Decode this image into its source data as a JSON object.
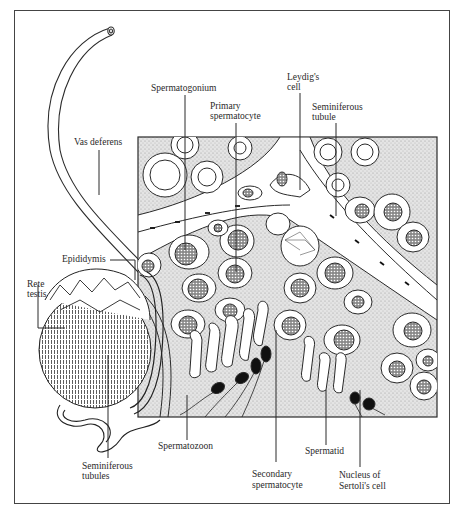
{
  "figure": {
    "labels": {
      "vas_deferens": "Vas deferens",
      "epididymis": "Epididymis",
      "rete_testis_1": "Rete",
      "rete_testis_2": "testis",
      "seminiferous_tubules_1": "Seminiferous",
      "seminiferous_tubules_2": "tubules",
      "spermatogonium": "Spermatogonium",
      "primary_spermatocyte_1": "Primary",
      "primary_spermatocyte_2": "spermatocyte",
      "leydigs_cell_1": "Leydig's",
      "leydigs_cell_2": "cell",
      "seminiferous_tubule_1": "Seminiferous",
      "seminiferous_tubule_2": "tubule",
      "spermatozoon": "Spermatozoon",
      "secondary_spermatocyte_1": "Secondary",
      "secondary_spermatocyte_2": "spermatocyte",
      "spermatid": "Spermatid",
      "nucleus_sertoli_1": "Nucleus of",
      "nucleus_sertoli_2": "Sertoli's cell"
    },
    "colors": {
      "line": "#2a2a2a",
      "tissue_fill": "#d9d9d9",
      "cell_fill": "#ffffff",
      "nucleus_fill": "#7a7a7a",
      "sperm_head": "#111111"
    }
  }
}
